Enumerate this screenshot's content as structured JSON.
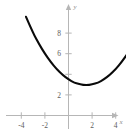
{
  "chart_data": {
    "type": "line",
    "title": "",
    "subtitle": "",
    "xlabel": "x",
    "ylabel": "y",
    "xlim": [
      -5.2,
      5.4
    ],
    "ylim": [
      -1.2,
      9.6
    ],
    "grid": false,
    "legend": null,
    "xticks": [
      -4,
      -2,
      2,
      4
    ],
    "xtick_labels": [
      "-4",
      "-2",
      "2",
      "4"
    ],
    "yticks": [
      2,
      4,
      6,
      8
    ],
    "ytick_labels": [
      "2",
      "4",
      "6",
      "8"
    ],
    "ytick_labels_visible": [
      "2",
      "6",
      "8"
    ],
    "curve_color": "#0a0a0a",
    "axis_color": "#b6b6b6",
    "label_color": "#5d5d5d",
    "series": [
      {
        "name": "parabola",
        "description": "upward opening parabola with vertex near (1, 3)",
        "vertex": [
          1,
          3
        ],
        "x": [
          -3.6,
          -3.0,
          -2.5,
          -2.0,
          -1.5,
          -1.0,
          -0.5,
          0.0,
          0.5,
          1.0,
          1.5,
          2.0,
          2.5,
          3.0,
          3.5,
          4.0,
          4.5,
          5.0
        ],
        "y": [
          9.58,
          8.0,
          6.94,
          6.0,
          5.19,
          4.5,
          3.94,
          3.5,
          3.19,
          3.0,
          2.94,
          3.0,
          3.19,
          3.5,
          3.94,
          4.5,
          5.19,
          6.0
        ],
        "equation": "y = 0.25(x - 1)^2 + 3"
      }
    ],
    "axis_ticks": {
      "x_labels": [
        "-4",
        "-2",
        "2",
        "4"
      ],
      "y_labels": [
        "2",
        "6",
        "8"
      ]
    }
  },
  "figure": {
    "x_axis_label": "x",
    "y_axis_label": "y",
    "x_tick_1": "-4",
    "x_tick_2": "-2",
    "x_tick_3": "2",
    "x_tick_4": "4",
    "y_tick_1": "2",
    "y_tick_2": "6",
    "y_tick_3": "8"
  }
}
